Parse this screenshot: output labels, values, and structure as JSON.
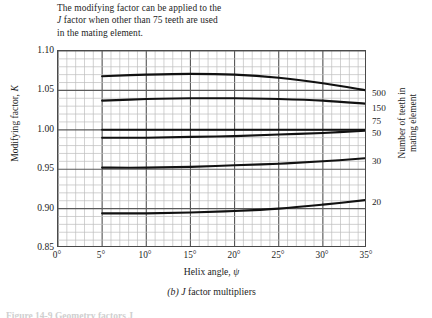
{
  "note": {
    "lines": [
      "The modifying factor can be applied to the",
      "J factor when other than 75 teeth are used",
      "in the mating element."
    ],
    "line1_pre": "The modifying factor can be applied to the",
    "line2_italic": "J",
    "line2_rest": " factor when other than 75 teeth are used",
    "line3": "in the mating element."
  },
  "axes": {
    "y_title_pre": "Modifying factor, ",
    "y_title_sym": "K",
    "x_title_pre": "Helix angle, ",
    "x_title_sym": "ψ",
    "right_title_line1": "Number of teeth in",
    "right_title_line2": "mating element",
    "y_ticks": [
      "1.10",
      "1.05",
      "1.00",
      "0.95",
      "0.90",
      "0.85"
    ],
    "x_ticks": [
      "0°",
      "5°",
      "10°",
      "15°",
      "20°",
      "25°",
      "30°",
      "35°"
    ]
  },
  "caption": {
    "part_label": "(b)",
    "symbol": "J",
    "text": " factor multipliers"
  },
  "footer": {
    "text": "Figure 14-9    Geometry factors J"
  },
  "colors": {
    "minor_grid": "#bdbdbd",
    "major_grid": "#5a5a5a",
    "frame": "#4a4a4a",
    "curve": "#111111",
    "background": "#ffffff"
  },
  "chart_data": {
    "type": "line",
    "title": "J factor multipliers",
    "xlabel": "Helix angle, ψ (degrees)",
    "ylabel": "Modifying factor, K",
    "xlim": [
      0,
      35
    ],
    "ylim": [
      0.85,
      1.1
    ],
    "x_tick_values": [
      0,
      5,
      10,
      15,
      20,
      25,
      30,
      35
    ],
    "y_tick_values": [
      0.85,
      0.9,
      0.95,
      1.0,
      1.05,
      1.1
    ],
    "grid": "major and minor (5 minor divisions per major cell)",
    "legend_position": "right end of each curve",
    "annotation": "The modifying factor can be applied to the J factor when other than 75 teeth are used in the mating element.",
    "series": [
      {
        "name": "500",
        "label": "500",
        "x": [
          5,
          10,
          15,
          20,
          25,
          30,
          35
        ],
        "values": [
          1.068,
          1.07,
          1.071,
          1.07,
          1.066,
          1.059,
          1.05
        ]
      },
      {
        "name": "150",
        "label": "150",
        "x": [
          5,
          10,
          15,
          20,
          25,
          30,
          35
        ],
        "values": [
          1.037,
          1.039,
          1.04,
          1.04,
          1.039,
          1.037,
          1.033
        ]
      },
      {
        "name": "75",
        "label": "75",
        "x": [
          5,
          10,
          15,
          20,
          25,
          30,
          35
        ],
        "values": [
          1.0,
          1.0,
          1.0,
          1.0,
          1.0,
          1.0,
          1.0
        ]
      },
      {
        "name": "50",
        "label": "50",
        "x": [
          5,
          10,
          15,
          20,
          25,
          30,
          35
        ],
        "values": [
          0.99,
          0.99,
          0.991,
          0.992,
          0.994,
          0.996,
          0.999
        ]
      },
      {
        "name": "30",
        "label": "30",
        "x": [
          5,
          10,
          15,
          20,
          25,
          30,
          35
        ],
        "values": [
          0.952,
          0.952,
          0.953,
          0.955,
          0.957,
          0.96,
          0.964
        ]
      },
      {
        "name": "20",
        "label": "20",
        "x": [
          5,
          10,
          15,
          20,
          25,
          30,
          35
        ],
        "values": [
          0.894,
          0.894,
          0.895,
          0.897,
          0.9,
          0.905,
          0.911
        ]
      }
    ]
  }
}
